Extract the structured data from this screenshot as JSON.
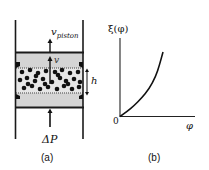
{
  "panel_a": {
    "caption": "(a)",
    "labels": {
      "v_piston_main": "v",
      "v_piston_sub": "piston",
      "v": "v",
      "h": "h",
      "delta_p": "ΔP"
    },
    "colors": {
      "wall": "#1a1a1a",
      "fluid": "#d4d4d4",
      "particle": "#111111",
      "membrane": "#888888"
    },
    "particles": [
      [
        22,
        72
      ],
      [
        30,
        70
      ],
      [
        38,
        73
      ],
      [
        46,
        71
      ],
      [
        55,
        72
      ],
      [
        62,
        70
      ],
      [
        70,
        73
      ],
      [
        78,
        72
      ],
      [
        20,
        80
      ],
      [
        27,
        78
      ],
      [
        35,
        81
      ],
      [
        43,
        79
      ],
      [
        52,
        82
      ],
      [
        60,
        78
      ],
      [
        66,
        81
      ],
      [
        74,
        79
      ],
      [
        80,
        82
      ],
      [
        24,
        88
      ],
      [
        32,
        86
      ],
      [
        40,
        89
      ],
      [
        48,
        87
      ],
      [
        57,
        89
      ],
      [
        64,
        86
      ],
      [
        72,
        89
      ],
      [
        79,
        87
      ],
      [
        28,
        84
      ],
      [
        45,
        84
      ],
      [
        68,
        84
      ],
      [
        36,
        76
      ],
      [
        58,
        75
      ]
    ]
  },
  "panel_b": {
    "caption": "(b)",
    "y_label": "ξ(φ)",
    "x_label": "φ",
    "origin_label": "0"
  },
  "chart_data": {
    "type": "line",
    "title": "",
    "xlabel": "φ",
    "ylabel": "ξ(φ)",
    "x_ticks": [
      "0"
    ],
    "y_ticks": [],
    "grid": false,
    "legend": null,
    "series": [
      {
        "name": "ξ(φ)",
        "x": [
          0,
          0.1,
          0.2,
          0.3,
          0.4,
          0.5,
          0.55,
          0.6
        ],
        "y": [
          0,
          0.07,
          0.15,
          0.25,
          0.37,
          0.55,
          0.7,
          0.88
        ]
      }
    ]
  }
}
